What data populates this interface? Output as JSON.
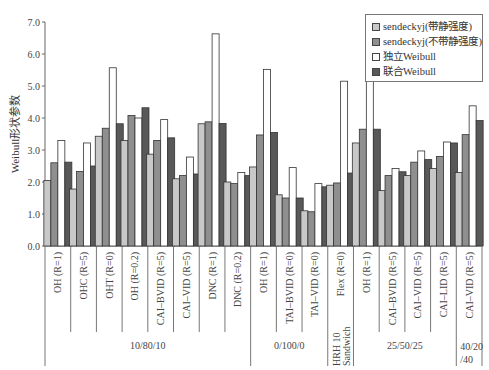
{
  "chart_data": {
    "type": "bar",
    "title": "",
    "xlabel": "",
    "ylabel": "Weibull形状参数",
    "ylim": [
      0,
      7.0
    ],
    "yticks": [
      "0.0",
      "1.0",
      "2.0",
      "3.0",
      "4.0",
      "5.0",
      "6.0",
      "7.0"
    ],
    "grid": false,
    "legend_position": "top-right",
    "categories": [
      "OH (R=1)",
      "OHC (R=5)",
      "OHT (R=0)",
      "OH (R=0.2)",
      "CAI–BVID (R=5)",
      "CAI–VID (R=5)",
      "DNC (R=1)",
      "DNC (R=0.2)",
      "OH (R=1)",
      "TAI–BVID (R=0)",
      "TAI–VID (R=0)",
      "Flex (R=0)",
      "OH (R=1)",
      "CAI–BVID (R=5)",
      "CAI–VID (R=5)",
      "CAI–LID (R=5)",
      "CAI–VID (R=5)"
    ],
    "groups": [
      {
        "label": "10/80/10",
        "start": 0,
        "end": 7
      },
      {
        "label": "0/100/0",
        "start": 8,
        "end": 10
      },
      {
        "label": "HRH 10 Sandwich",
        "start": 11,
        "end": 11
      },
      {
        "label": "25/50/25",
        "start": 12,
        "end": 15
      },
      {
        "label": "40/20/40",
        "start": 16,
        "end": 16
      }
    ],
    "series": [
      {
        "name": "sendeckyj(带静强度)",
        "color": "#c8c8c8",
        "values": [
          2.05,
          1.78,
          3.43,
          3.3,
          2.87,
          2.1,
          3.82,
          2.0,
          2.47,
          1.6,
          1.1,
          1.9,
          3.22,
          1.73,
          2.2,
          2.42,
          2.3
        ]
      },
      {
        "name": "sendeckyj(不带静强度)",
        "color": "#8f8f8f",
        "values": [
          2.6,
          2.33,
          3.68,
          4.08,
          3.3,
          2.2,
          3.88,
          1.95,
          3.47,
          1.5,
          1.07,
          1.97,
          3.65,
          2.2,
          2.62,
          2.8,
          3.48
        ]
      },
      {
        "name": "独立Weibull",
        "color": "#ffffff",
        "values": [
          3.3,
          3.22,
          5.57,
          4.0,
          3.95,
          2.78,
          6.63,
          2.3,
          5.52,
          2.45,
          1.95,
          5.15,
          5.72,
          2.42,
          2.97,
          3.25,
          4.38
        ]
      },
      {
        "name": "联合Weibull",
        "color": "#595959",
        "values": [
          2.62,
          2.5,
          3.82,
          4.32,
          3.38,
          2.25,
          3.83,
          2.2,
          3.55,
          1.5,
          1.85,
          2.28,
          3.65,
          2.32,
          2.7,
          3.22,
          3.92
        ]
      }
    ]
  },
  "legend": {
    "items": [
      {
        "label": "sendeckyj(带静强度)",
        "color": "#c8c8c8"
      },
      {
        "label": "sendeckyj(不带静强度)",
        "color": "#8f8f8f"
      },
      {
        "label": "独立Weibull",
        "color": "#ffffff"
      },
      {
        "label": "联合Weibull",
        "color": "#595959"
      }
    ]
  }
}
